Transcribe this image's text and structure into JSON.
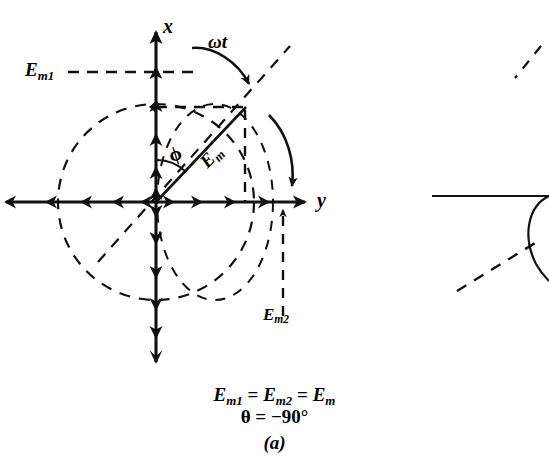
{
  "figure": {
    "kind": "phasor-diagram",
    "panel_label": "(a)",
    "caption_line_1_html": "E<sub>m1</sub> = E<sub>m2</sub> = E<sub>m</sub>",
    "caption_line_2_html": "θ = −90°",
    "theta_value": "−90°",
    "axes": {
      "vertical_label": "x",
      "horizontal_label": "y"
    },
    "labels": {
      "em1": "E",
      "em1_sub": "m1",
      "em2": "E",
      "em2_sub": "m2",
      "em": "E",
      "em_sub": "m",
      "omega_t": "ωt",
      "phi": "ϕ"
    },
    "colors": {
      "ink": "#111111",
      "background": "#ffffff"
    },
    "geometry": {
      "origin_x": 156,
      "origin_y": 202,
      "circle_radius": 98,
      "tip_x": 245,
      "tip_y": 107,
      "phi_degrees": 45
    }
  },
  "partial_figure_right": {
    "note": "cropped neighbouring figure at right edge",
    "visible": true
  }
}
